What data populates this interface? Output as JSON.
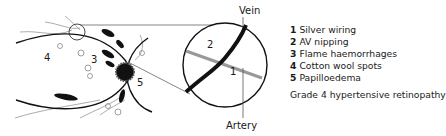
{
  "labels": {
    "vein": "Vein",
    "artery": "Artery",
    "fundus_marks": [
      "4",
      "3",
      "5"
    ],
    "inset_marks": [
      "2",
      "1"
    ]
  },
  "legend": {
    "items": [
      {
        "num": "1",
        "text": "Silver wiring"
      },
      {
        "num": "2",
        "text": "AV nipping"
      },
      {
        "num": "3",
        "text": "Flame haemorrhages"
      },
      {
        "num": "4",
        "text": "Cotton wool spots"
      },
      {
        "num": "5",
        "text": "Papilloedema"
      }
    ],
    "caption": "Grade 4 hypertensive retinopathy"
  }
}
